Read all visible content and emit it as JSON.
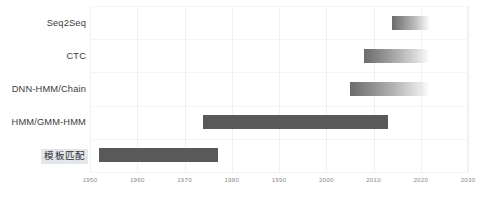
{
  "chart_data": {
    "type": "bar",
    "orientation": "horizontal",
    "subtype": "gantt-timeline",
    "title": "",
    "xlabel": "",
    "ylabel": "",
    "xlim": [
      1950,
      2030
    ],
    "grid": true,
    "legend": "none",
    "xticks": [
      "1950",
      "1960",
      "1970",
      "1980",
      "1990",
      "2000",
      "2010",
      "2020",
      "2030"
    ],
    "xtick_values": [
      1950,
      1960,
      1970,
      1980,
      1990,
      2000,
      2010,
      2020,
      2030
    ],
    "categories": [
      "Seq2Seq",
      "CTC",
      "DNN-HMM/Chain",
      "HMM/GMM-HMM",
      "模板匹配"
    ],
    "bars": [
      {
        "label": "Seq2Seq",
        "start": 2014,
        "end": 2022,
        "style": "fade",
        "selected": false
      },
      {
        "label": "CTC",
        "start": 2008,
        "end": 2022,
        "style": "fade",
        "selected": false
      },
      {
        "label": "DNN-HMM/Chain",
        "start": 2005,
        "end": 2022,
        "style": "fade",
        "selected": false
      },
      {
        "label": "HMM/GMM-HMM",
        "start": 1974,
        "end": 2013,
        "style": "solid",
        "selected": false
      },
      {
        "label": "模板匹配",
        "start": 1952,
        "end": 1977,
        "style": "solid",
        "selected": true
      }
    ],
    "colors": {
      "bar_solid": "#595959",
      "bar_fade_start": "#6b6b6b",
      "gridline": "#f0f0f0",
      "axis": "#e6e6e6",
      "label_text": "#3b3b3b",
      "tick_text": "#8a8a8a",
      "selection_highlight": "#e3e7ec",
      "background": "#ffffff"
    }
  }
}
